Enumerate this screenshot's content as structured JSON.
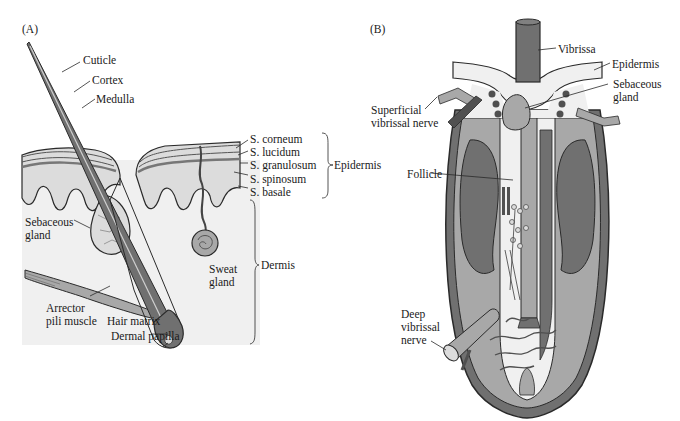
{
  "figure": {
    "panels": [
      {
        "id": "A",
        "tag": "(A)",
        "title": "Skin with hair follicle",
        "labels": {
          "cuticle": "Cuticle",
          "cortex": "Cortex",
          "medulla": "Medulla",
          "s_corneum": "S. corneum",
          "s_lucidum": "S. lucidum",
          "s_granulosum": "S. granulosum",
          "s_spinosum": "S. spinosum",
          "s_basale": "S. basale",
          "epidermis": "Epidermis",
          "dermis": "Dermis",
          "sebaceous_gland_1": "Sebaceous",
          "sebaceous_gland_2": "gland",
          "sweat_gland_1": "Sweat",
          "sweat_gland_2": "gland",
          "arrector_1": "Arrector",
          "arrector_2": "pili muscle",
          "hair_matrix": "Hair matrix",
          "dermal_papilla": "Dermal papilla"
        }
      },
      {
        "id": "B",
        "tag": "(B)",
        "title": "Vibrissa follicle",
        "labels": {
          "vibrissa": "Vibrissa",
          "epidermis": "Epidermis",
          "sebaceous_gland_1": "Sebaceous",
          "sebaceous_gland_2": "gland",
          "superficial_nerve_1": "Superficial",
          "superficial_nerve_2": "vibrissal nerve",
          "follicle": "Follicle",
          "deep_nerve_1": "Deep",
          "deep_nerve_2": "vibrissal",
          "deep_nerve_3": "nerve"
        }
      }
    ],
    "colors": {
      "background": "#ffffff",
      "dermis_bg": "#f0f0f0",
      "tissue_light": "#dcdcdc",
      "tissue_mid": "#a8a8a8",
      "tissue_dark": "#707070",
      "tissue_darkest": "#505050",
      "outline": "#2a2a2a"
    }
  }
}
